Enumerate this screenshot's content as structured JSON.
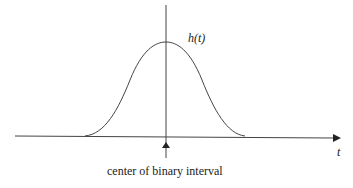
{
  "diagram": {
    "curve_label": "h(t)",
    "axis_label": "t",
    "caption": "center of binary interval",
    "line_color": "#333333"
  }
}
